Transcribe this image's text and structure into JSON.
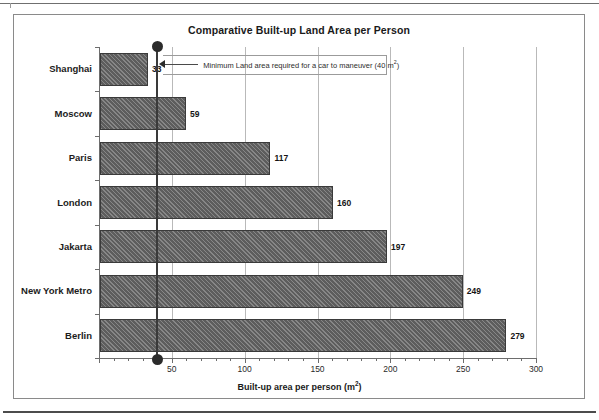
{
  "chart_data": {
    "type": "bar",
    "orientation": "horizontal",
    "title": "Comparative Built-up Land Area per Person",
    "xlabel": "Built-up area per person (m²)",
    "ylabel": "",
    "categories": [
      "Shanghai",
      "Moscow",
      "Paris",
      "London",
      "Jakarta",
      "New York Metro",
      "Berlin"
    ],
    "values": [
      33,
      59,
      117,
      160,
      197,
      249,
      279
    ],
    "value_labels": [
      "33",
      "59",
      "117",
      "160",
      "197",
      "249",
      "279"
    ],
    "xlim": [
      0,
      300
    ],
    "xticks": [
      0,
      50,
      100,
      150,
      200,
      250,
      300
    ],
    "xtick_labels": [
      "",
      "50",
      "100",
      "150",
      "200",
      "250",
      "300"
    ],
    "minor_tick_step": 10,
    "grid": "vertical",
    "legend": "none",
    "bar_color": "#5d5d5d",
    "bar_pattern": "diagonal-hatch",
    "annotations": [
      {
        "name": "minimum-land-area-threshold",
        "text": "Minimum Land area required for a car to maneuver (40 m²)",
        "value": 40,
        "marker": "vertical-line-with-end-dots"
      }
    ]
  },
  "axis": {
    "x_title_main": "Built-up area per person (m",
    "x_title_sup": "2",
    "x_title_tail": ")"
  },
  "annotation": {
    "text_main": "Minimum Land area required for a car to maneuver (40 m",
    "text_sup": "2",
    "text_tail": ")"
  }
}
